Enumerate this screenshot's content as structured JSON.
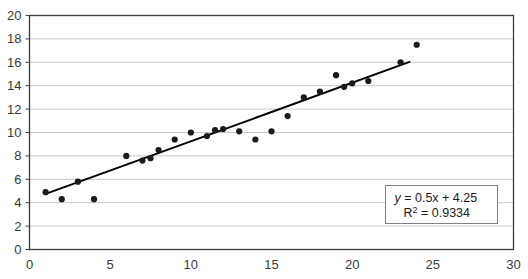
{
  "chart_data": {
    "type": "scatter",
    "title": "",
    "xlabel": "",
    "ylabel": "",
    "xlim": [
      0,
      30
    ],
    "ylim": [
      0,
      20
    ],
    "xticks": [
      0,
      5,
      10,
      15,
      20,
      25,
      30
    ],
    "yticks": [
      0,
      2,
      4,
      6,
      8,
      10,
      12,
      14,
      16,
      18,
      20
    ],
    "grid": "horizontal",
    "legend": "none",
    "marker_color": "#1a1a1a",
    "trendline_color": "#000000",
    "gridline_color": "#c8c8c8",
    "border_color": "#3c3c3c",
    "background_color": "#ffffff",
    "points": [
      {
        "x": 1.0,
        "y": 4.9
      },
      {
        "x": 2.0,
        "y": 4.3
      },
      {
        "x": 3.0,
        "y": 5.8
      },
      {
        "x": 4.0,
        "y": 4.3
      },
      {
        "x": 6.0,
        "y": 8.0
      },
      {
        "x": 7.0,
        "y": 7.6
      },
      {
        "x": 7.5,
        "y": 7.8
      },
      {
        "x": 8.0,
        "y": 8.5
      },
      {
        "x": 9.0,
        "y": 9.4
      },
      {
        "x": 10.0,
        "y": 10.0
      },
      {
        "x": 11.0,
        "y": 9.7
      },
      {
        "x": 11.5,
        "y": 10.2
      },
      {
        "x": 12.0,
        "y": 10.3
      },
      {
        "x": 13.0,
        "y": 10.1
      },
      {
        "x": 14.0,
        "y": 9.4
      },
      {
        "x": 15.0,
        "y": 10.1
      },
      {
        "x": 16.0,
        "y": 11.4
      },
      {
        "x": 17.0,
        "y": 13.0
      },
      {
        "x": 18.0,
        "y": 13.5
      },
      {
        "x": 19.0,
        "y": 14.9
      },
      {
        "x": 19.5,
        "y": 13.9
      },
      {
        "x": 20.0,
        "y": 14.2
      },
      {
        "x": 21.0,
        "y": 14.4
      },
      {
        "x": 23.0,
        "y": 16.0
      },
      {
        "x": 24.0,
        "y": 17.5
      }
    ],
    "trendline": {
      "slope": 0.5,
      "intercept": 4.25,
      "x_start": 1.0,
      "x_end": 23.6
    },
    "annotation": {
      "equation_prefix": "y",
      "equation_body": " = 0.5x + 4.25",
      "r_squared_prefix": "R",
      "r_squared_exponent": "2",
      "r_squared_body": " = 0.9334"
    }
  }
}
